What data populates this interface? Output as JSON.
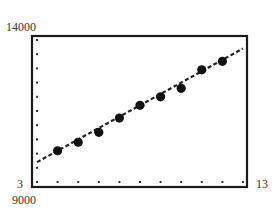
{
  "chart_data": {
    "type": "scatter",
    "title": "",
    "xlabel": "",
    "ylabel": "",
    "xlim": [
      3,
      13
    ],
    "ylim": [
      9000,
      14000
    ],
    "x_tick_step": 1,
    "y_tick_step": 500,
    "grid": false,
    "tick_style": "dots",
    "axis_labels": {
      "xmin": "3",
      "xmax": "13",
      "ymin": "9000",
      "ymax": "14000"
    },
    "series": [
      {
        "name": "data",
        "kind": "scatter",
        "x": [
          4,
          5,
          6,
          7,
          8,
          9,
          10,
          11,
          12
        ],
        "y": [
          10100,
          10400,
          10750,
          11250,
          11700,
          12000,
          12300,
          12950,
          13250
        ]
      },
      {
        "name": "regression line",
        "kind": "dashed-line",
        "x": [
          3,
          13
        ],
        "y": [
          9700,
          13700
        ]
      }
    ]
  },
  "colors": {
    "frame": "#1a1a1a",
    "points": "#111111",
    "line": "#222222",
    "ticks": "#333333"
  }
}
